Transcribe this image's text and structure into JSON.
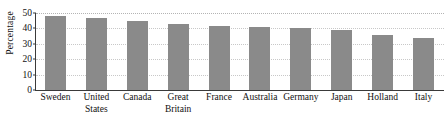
{
  "chart_data": {
    "type": "bar",
    "title": "",
    "xlabel": "",
    "ylabel": "Percentage",
    "ylim": [
      0,
      50
    ],
    "yticks": [
      0,
      10,
      20,
      30,
      40,
      50
    ],
    "grid": true,
    "legend": "none",
    "bar_color": "#8a8a8a",
    "categories": [
      "Sweden",
      "United States",
      "Canada",
      "Great Britain",
      "France",
      "Australia",
      "Germany",
      "Japan",
      "Holland",
      "Italy"
    ],
    "category_lines": [
      [
        "Sweden"
      ],
      [
        "United",
        "States"
      ],
      [
        "Canada"
      ],
      [
        "Great",
        "Britain"
      ],
      [
        "France"
      ],
      [
        "Australia"
      ],
      [
        "Germany"
      ],
      [
        "Japan"
      ],
      [
        "Holland"
      ],
      [
        "Italy"
      ]
    ],
    "values": [
      48,
      46.5,
      45,
      43,
      41.5,
      41,
      40.5,
      39,
      36,
      33.5
    ]
  }
}
